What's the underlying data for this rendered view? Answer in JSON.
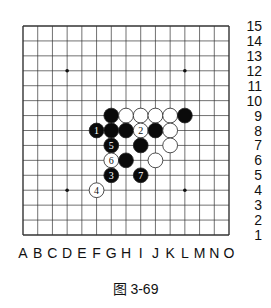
{
  "board": {
    "size": 15,
    "columns": [
      "A",
      "B",
      "C",
      "D",
      "E",
      "F",
      "G",
      "H",
      "I",
      "J",
      "K",
      "L",
      "M",
      "N",
      "O"
    ],
    "rows": [
      "1",
      "2",
      "3",
      "4",
      "5",
      "6",
      "7",
      "8",
      "9",
      "10",
      "11",
      "12",
      "13",
      "14",
      "15"
    ],
    "star_points": [
      "D4",
      "L4",
      "D12",
      "L12"
    ],
    "line_color": "#333333",
    "stones": [
      {
        "pos": "G9",
        "color": "black",
        "label": ""
      },
      {
        "pos": "H9",
        "color": "white",
        "label": ""
      },
      {
        "pos": "I9",
        "color": "white",
        "label": ""
      },
      {
        "pos": "J9",
        "color": "white",
        "label": ""
      },
      {
        "pos": "K9",
        "color": "white",
        "label": ""
      },
      {
        "pos": "L9",
        "color": "black",
        "label": ""
      },
      {
        "pos": "F8",
        "color": "black",
        "label": "1"
      },
      {
        "pos": "G8",
        "color": "black",
        "label": ""
      },
      {
        "pos": "H8",
        "color": "black",
        "label": ""
      },
      {
        "pos": "I8",
        "color": "white",
        "label": "2"
      },
      {
        "pos": "J8",
        "color": "black",
        "label": ""
      },
      {
        "pos": "K8",
        "color": "white",
        "label": ""
      },
      {
        "pos": "G7",
        "color": "black",
        "label": "5"
      },
      {
        "pos": "I7",
        "color": "black",
        "label": ""
      },
      {
        "pos": "K7",
        "color": "white",
        "label": ""
      },
      {
        "pos": "G6",
        "color": "white",
        "label": "6"
      },
      {
        "pos": "H6",
        "color": "black",
        "label": ""
      },
      {
        "pos": "J6",
        "color": "white",
        "label": ""
      },
      {
        "pos": "G5",
        "color": "black",
        "label": "3"
      },
      {
        "pos": "I5",
        "color": "black",
        "label": "7"
      },
      {
        "pos": "F4",
        "color": "white",
        "label": "4"
      }
    ]
  },
  "caption": "图 3-69"
}
